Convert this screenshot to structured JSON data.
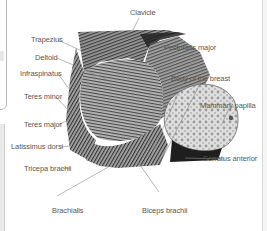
{
  "diagram": {
    "labels": {
      "clavicle": "Clavicle",
      "trapezius": "Trapezius",
      "deltoid": "Deltoid",
      "pectoralis_major": "Pectoralis major",
      "infraspinatus": "Infraspinatus",
      "body_of_breast": "Body of the breast",
      "teres_minor": "Teres minor",
      "mammary_papilla": "Mammary papilla",
      "teres_major": "Teres major",
      "latissimus_dorsi": "Latissimus dorsi",
      "serratus_anterior": "Serratus anterior",
      "triceps_brachii": "Tricepa brachii",
      "brachialis": "Brachialis",
      "biceps_brachii": "Biceps brachii"
    },
    "colors": {
      "label_text": "#5a5a5a",
      "leader_line": "#8a8a8a",
      "muscle_dark": "#3a3a3a",
      "muscle_light": "#d9d9d9",
      "border": "#b9b9b9"
    }
  }
}
